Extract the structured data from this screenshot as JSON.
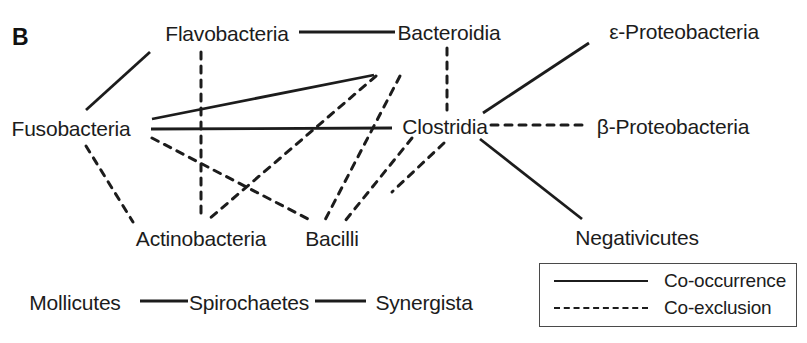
{
  "figure": {
    "panel_label": "B",
    "line_color": "#1c1c1c",
    "text_color": "#1c1c1c",
    "background": "#ffffff"
  },
  "nodes": [
    {
      "id": "flavobacteria",
      "label": "Flavobacteria",
      "x": 227,
      "y": 33
    },
    {
      "id": "bacteroidia",
      "label": "Bacteroidia",
      "x": 449,
      "y": 32
    },
    {
      "id": "eproteobacteria",
      "label": "ε-Proteobacteria",
      "x": 684,
      "y": 31
    },
    {
      "id": "fusobacteria",
      "label": "Fusobacteria",
      "x": 71,
      "y": 128
    },
    {
      "id": "clostridia",
      "label": "Clostridia",
      "x": 445,
      "y": 126
    },
    {
      "id": "bproteobacteria",
      "label": "β-Proteobacteria",
      "x": 673,
      "y": 126
    },
    {
      "id": "actinobacteria",
      "label": "Actinobacteria",
      "x": 201,
      "y": 238
    },
    {
      "id": "bacilli",
      "label": "Bacilli",
      "x": 332,
      "y": 238
    },
    {
      "id": "negativicutes",
      "label": "Negativicutes",
      "x": 637,
      "y": 237
    },
    {
      "id": "mollicutes",
      "label": "Mollicutes",
      "x": 75,
      "y": 302
    },
    {
      "id": "spirochaetes",
      "label": "Spirochaetes",
      "x": 249,
      "y": 302
    },
    {
      "id": "synergista",
      "label": "Synergista",
      "x": 424,
      "y": 302
    }
  ],
  "edges": [
    {
      "source": "flavobacteria",
      "target": "bacteroidia",
      "type": "co-occurrence",
      "x1": 299,
      "y1": 32,
      "x2": 395,
      "y2": 32
    },
    {
      "source": "fusobacteria",
      "target": "flavobacteria",
      "type": "co-occurrence",
      "x1": 86,
      "y1": 110,
      "x2": 150,
      "y2": 52
    },
    {
      "source": "fusobacteria",
      "target": "bacteroidia",
      "type": "co-occurrence",
      "x1": 152,
      "y1": 119,
      "x2": 374,
      "y2": 75
    },
    {
      "source": "fusobacteria",
      "target": "clostridia",
      "type": "co-occurrence",
      "x1": 151,
      "y1": 129,
      "x2": 392,
      "y2": 128
    },
    {
      "source": "clostridia",
      "target": "eproteobacteria",
      "type": "co-occurrence",
      "x1": 483,
      "y1": 113,
      "x2": 589,
      "y2": 43
    },
    {
      "source": "clostridia",
      "target": "negativicutes",
      "type": "co-occurrence",
      "x1": 480,
      "y1": 139,
      "x2": 582,
      "y2": 219
    },
    {
      "source": "mollicutes",
      "target": "spirochaetes",
      "type": "co-occurrence",
      "x1": 140,
      "y1": 301,
      "x2": 188,
      "y2": 301
    },
    {
      "source": "spirochaetes",
      "target": "synergista",
      "type": "co-occurrence",
      "x1": 315,
      "y1": 301,
      "x2": 366,
      "y2": 301
    },
    {
      "source": "flavobacteria",
      "target": "actinobacteria",
      "type": "co-exclusion",
      "x1": 201,
      "y1": 52,
      "x2": 201,
      "y2": 219
    },
    {
      "source": "bacteroidia",
      "target": "clostridia",
      "type": "co-exclusion",
      "x1": 447,
      "y1": 48,
      "x2": 447,
      "y2": 110
    },
    {
      "source": "bacteroidia",
      "target": "actinobacteria",
      "type": "co-exclusion",
      "x1": 376,
      "y1": 76,
      "x2": 208,
      "y2": 220
    },
    {
      "source": "bacteroidia",
      "target": "bacilli",
      "type": "co-exclusion",
      "x1": 400,
      "y1": 76,
      "x2": 325,
      "y2": 220
    },
    {
      "source": "fusobacteria",
      "target": "actinobacteria",
      "type": "co-exclusion",
      "x1": 86,
      "y1": 146,
      "x2": 133,
      "y2": 222
    },
    {
      "source": "fusobacteria",
      "target": "bacilli",
      "type": "co-exclusion",
      "x1": 152,
      "y1": 138,
      "x2": 312,
      "y2": 221
    },
    {
      "source": "clostridia",
      "target": "bacilli",
      "type": "co-exclusion",
      "x1": 412,
      "y1": 138,
      "x2": 345,
      "y2": 221
    },
    {
      "source": "clostridia",
      "target": "bproteobacteria",
      "type": "co-exclusion",
      "x1": 491,
      "y1": 125,
      "x2": 582,
      "y2": 125
    },
    {
      "source": "clostridia",
      "target": "negativicutes",
      "type": "co-exclusion",
      "x1": 444,
      "y1": 143,
      "x2": 392,
      "y2": 192
    }
  ],
  "legend": {
    "items": [
      {
        "style": "solid",
        "label": "Co-occurrence"
      },
      {
        "style": "dashed",
        "label": "Co-exclusion"
      }
    ]
  }
}
